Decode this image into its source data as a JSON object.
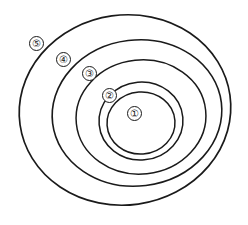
{
  "figure": {
    "background_color": "#ffffff",
    "stroke_color": "#1a1a1a",
    "width": 248,
    "height": 225
  },
  "diagram": {
    "type": "nested-circles",
    "ring_count": 5,
    "rings": [
      {
        "id": "ring-1",
        "label": "①",
        "label_text": "1",
        "order_from_inside": 1,
        "cx": 141,
        "cy": 123,
        "rx": 34,
        "ry": 31,
        "rotation": -4,
        "stroke_width": 1.5,
        "label_x": 127,
        "label_y": 106
      },
      {
        "id": "ring-2",
        "label": "②",
        "label_text": "2",
        "order_from_inside": 2,
        "cx": 141,
        "cy": 121,
        "rx": 42,
        "ry": 39,
        "rotation": -5,
        "stroke_width": 1.5,
        "label_x": 102,
        "label_y": 88
      },
      {
        "id": "ring-3",
        "label": "③",
        "label_text": "3",
        "order_from_inside": 3,
        "cx": 141,
        "cy": 117,
        "rx": 65,
        "ry": 57,
        "rotation": -6,
        "stroke_width": 1.5,
        "label_x": 82,
        "label_y": 66
      },
      {
        "id": "ring-4",
        "label": "④",
        "label_text": "4",
        "order_from_inside": 4,
        "cx": 137,
        "cy": 113,
        "rx": 85,
        "ry": 73,
        "rotation": -7,
        "stroke_width": 1.6,
        "label_x": 56,
        "label_y": 52
      },
      {
        "id": "ring-5",
        "label": "⑤",
        "label_text": "5",
        "order_from_inside": 5,
        "cx": 125,
        "cy": 110,
        "rx": 106,
        "ry": 95,
        "rotation": -8,
        "stroke_width": 1.7,
        "label_x": 29,
        "label_y": 36
      }
    ]
  }
}
